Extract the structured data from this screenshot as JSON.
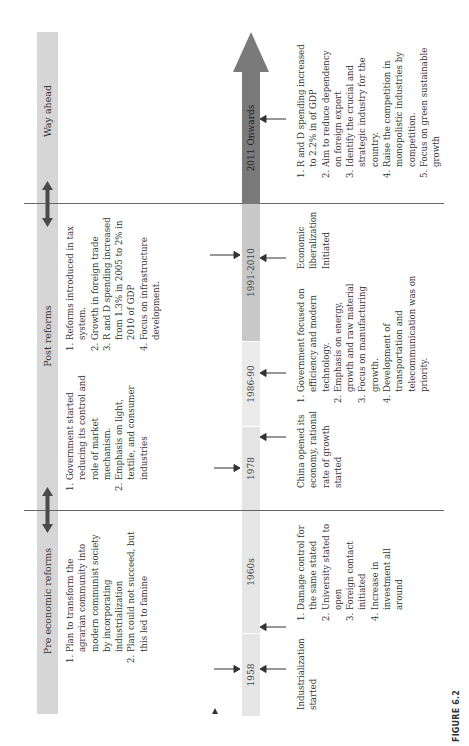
{
  "figure": {
    "label": "FIGURE 6.2"
  },
  "phases": [
    {
      "id": "pre",
      "label": "Pre economic reforms"
    },
    {
      "id": "post",
      "label": "Post reforms"
    },
    {
      "id": "ahead",
      "label": "Way ahead"
    }
  ],
  "timeline": [
    {
      "label": "1958",
      "color": "#e6e6e6"
    },
    {
      "label": "1960s",
      "color": "#e6e6e6"
    },
    {
      "label": "1978",
      "color": "#e4e4e4"
    },
    {
      "label": "1986-90",
      "color": "#ebebeb"
    },
    {
      "label": "1991-2010",
      "color": "#c8c8c8"
    },
    {
      "label": "2011 Onwards",
      "color": "#7a7a7a"
    }
  ],
  "above_notes": {
    "pre": [
      "Plan to transform the agrarian community into modern communist society by incorporating industrialization",
      "Plan could not succeed, but this led to famine"
    ],
    "1978": [
      "Government started reducing its control and role of market mechanism.",
      "Emphasis on light, textile, and consumer industries"
    ],
    "post": [
      "Reforms introduced in tax system.",
      "Growth in foreign trade",
      "R and D spending increased from 1.3% in 2005 to 2% in 2010 of GDP",
      "Focus on infrastructure development."
    ]
  },
  "below_notes": {
    "1958": "Industrialization started",
    "1960s": [
      "Damage control for the same stated",
      "University stated to open",
      "Foreign contact initiated",
      "Increase in investment all around"
    ],
    "1978": "China opened its economy, rational rate of growth started",
    "1986-90": [
      "Government focused on efficiency and modern technology.",
      "Emphasis on energy, growth and raw material",
      "Focus on manufacturing growth.",
      "Development of transportation and telecommunication was on priority."
    ],
    "1991-2010": "Economic liberalization Initiated",
    "2011": [
      "R and D spending increased to 2.2% in of GDP",
      "Aim to reduce dependency on foreign export",
      "Identify the crucial and strategic industry for the country.",
      "Raise the competition in monopolistic industries by competition.",
      "Focus on green sustainable growth"
    ]
  },
  "colors": {
    "header": "#d6d6d6",
    "divider": "#666666",
    "arrow_dark": "#7a7a7a",
    "double_arrow": "#4a4a4a"
  }
}
